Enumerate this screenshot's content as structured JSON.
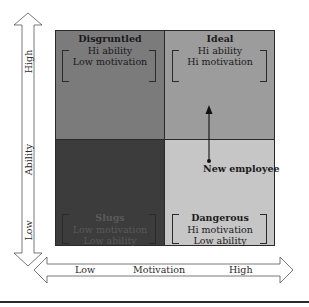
{
  "diagram": {
    "type": "2x2 matrix",
    "axes": {
      "vertical": {
        "label": "Ability",
        "high": "High",
        "low": "Low"
      },
      "horizontal": {
        "label": "Motivation",
        "low": "Low",
        "high": "High"
      }
    },
    "quadrants": {
      "top_left": {
        "title": "Disgruntled",
        "line1": "Hi ability",
        "line2": "Low motivation",
        "color": "#7b7b7b"
      },
      "top_right": {
        "title": "Ideal",
        "line1": "Hi ability",
        "line2": "Hi motivation",
        "color": "#9c9c9c"
      },
      "bottom_left": {
        "title": "Slugs",
        "line1": "Low motivation",
        "line2": "Low ability",
        "color": "#3c3c3c"
      },
      "bottom_right": {
        "title": "Dangerous",
        "line1": "Hi motivation",
        "line2": "Low ability",
        "color": "#c6c6c6"
      }
    },
    "marker": {
      "label": "New employee",
      "from_quadrant": "bottom_right",
      "to_quadrant": "top_right"
    }
  }
}
